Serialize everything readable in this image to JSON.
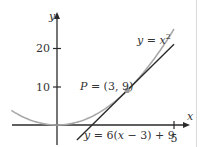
{
  "chart_data": {
    "type": "line",
    "title": "",
    "xlabel": "x",
    "ylabel": "y",
    "xlim": [
      -2.4,
      5.5
    ],
    "ylim": [
      -3,
      25
    ],
    "x_ticks": [
      5
    ],
    "x_tick_labels": [
      "5"
    ],
    "y_ticks": [
      10,
      20
    ],
    "y_tick_labels": [
      "10",
      "20"
    ],
    "grid": false,
    "series": [
      {
        "name": "y = x²",
        "label": "y = x",
        "superscript": "2",
        "function": "x^2",
        "color": "#a8a8a8"
      },
      {
        "name": "y = 6(x − 3) + 9",
        "label": "y = 6(x − 3) + 9",
        "function": "6*(x-3)+9",
        "color": "#2a2a2a"
      }
    ],
    "annotations": [
      {
        "text": "P = (3, 9)",
        "x": 3,
        "y": 9,
        "marker_color": "#9a9a9a"
      }
    ]
  },
  "labels": {
    "x_axis": "x",
    "y_axis": "y",
    "tick_20": "20",
    "tick_10": "10",
    "tick_5": "5",
    "curve_label_main": "y = x",
    "curve_label_sup": "2",
    "point_label": "P = (3, 9)",
    "tangent_label": "y = 6(x − 3) + 9"
  }
}
